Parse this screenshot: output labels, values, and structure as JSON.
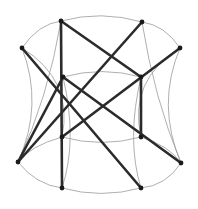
{
  "figure": {
    "width": 198,
    "height": 209,
    "background_color": "#ffffff",
    "straight_edge_color": "#2b2b2b",
    "arc_edge_color": "#9a9a9a",
    "vertex_color": "#1a1a1a",
    "vertex_radius": 2.4,
    "straight_edge_width": 2.6,
    "arc_edge_width": 0.8
  },
  "chart_data": {
    "type": "scatter",
    "xlabel": "",
    "ylabel": "",
    "xlim": [
      0,
      198
    ],
    "ylim": [
      0,
      209
    ],
    "grid": false,
    "legend": "none",
    "vertices": [
      {
        "id": "v1",
        "label": "top-left",
        "x": 61,
        "y": 21
      },
      {
        "id": "v2",
        "label": "top-right",
        "x": 142,
        "y": 22
      },
      {
        "id": "v3",
        "label": "upper-left",
        "x": 22,
        "y": 48
      },
      {
        "id": "v4",
        "label": "upper-right",
        "x": 180,
        "y": 48
      },
      {
        "id": "v5",
        "label": "inner-upper-left",
        "x": 63,
        "y": 77
      },
      {
        "id": "v6",
        "label": "inner-upper-right",
        "x": 141,
        "y": 77
      },
      {
        "id": "v7",
        "label": "inner-lower-left",
        "x": 62,
        "y": 137
      },
      {
        "id": "v8",
        "label": "inner-lower-right",
        "x": 141,
        "y": 137
      },
      {
        "id": "v9",
        "label": "lower-left",
        "x": 18,
        "y": 162
      },
      {
        "id": "v10",
        "label": "lower-right",
        "x": 181,
        "y": 163
      },
      {
        "id": "v11",
        "label": "bottom-left",
        "x": 62,
        "y": 188
      },
      {
        "id": "v12",
        "label": "bottom-right",
        "x": 141,
        "y": 188
      }
    ],
    "straight_edges": [
      {
        "from": "v1",
        "to": "v11",
        "d": "M 61 21 L 62 188"
      },
      {
        "from": "v6",
        "to": "v8",
        "d": "M 141 77 L 141 137"
      },
      {
        "from": "v3",
        "to": "v12",
        "d": "M 22 48 L 141 188"
      },
      {
        "from": "v2",
        "to": "v9",
        "d": "M 142 22 L 18 162"
      },
      {
        "from": "v5",
        "to": "v10",
        "d": "M 63 77 L 181 163"
      },
      {
        "from": "v4",
        "to": "v7",
        "d": "M 180 48 L 62 137"
      },
      {
        "from": "v9",
        "to": "v5",
        "d": "M 18 162 L 63 77"
      },
      {
        "from": "v1",
        "to": "v6",
        "d": "M 61 21 L 141 77"
      }
    ],
    "arc_edges": [
      {
        "from": "v3",
        "to": "v1",
        "d": "M 22 48 Q 38 24 61 21"
      },
      {
        "from": "v1",
        "to": "v2",
        "d": "M 61 21 Q 101 10 142 22"
      },
      {
        "from": "v2",
        "to": "v4",
        "d": "M 142 22 Q 165 25 180 48"
      },
      {
        "from": "v4",
        "to": "v10",
        "d": "M 180 48 Q 156 105 181 163"
      },
      {
        "from": "v10",
        "to": "v12",
        "d": "M 181 163 Q 166 186 141 188"
      },
      {
        "from": "v12",
        "to": "v11",
        "d": "M 141 188 Q 101 199 62 188"
      },
      {
        "from": "v11",
        "to": "v9",
        "d": "M 62 188 Q 36 185 18 162"
      },
      {
        "from": "v9",
        "to": "v3",
        "d": "M 18 162 Q 44 105 22 48"
      },
      {
        "from": "v5",
        "to": "v6",
        "d": "M 63 77 Q 102 66 141 77"
      },
      {
        "from": "v7",
        "to": "v8",
        "d": "M 62 137 Q 102 148 141 137"
      },
      {
        "from": "v3",
        "to": "v7",
        "d": "M 22 48 Q 74 80 62 137"
      },
      {
        "from": "v1",
        "to": "v9",
        "d": "M 61 21 Q 48 98 18 162"
      },
      {
        "from": "v4",
        "to": "v8",
        "d": "M 180 48 Q 128 80 141 137"
      },
      {
        "from": "v2",
        "to": "v10",
        "d": "M 142 22 Q 154 98 181 163"
      },
      {
        "from": "v5",
        "to": "v11",
        "d": "M 63 77 Q 78 140 62 188"
      },
      {
        "from": "v6",
        "to": "v12",
        "d": "M 141 77 Q 126 140 141 188"
      },
      {
        "from": "v7",
        "to": "v9",
        "d": "M 62 137 Q 30 146 18 162"
      },
      {
        "from": "v8",
        "to": "v10",
        "d": "M 141 137 Q 170 146 181 163"
      }
    ]
  }
}
